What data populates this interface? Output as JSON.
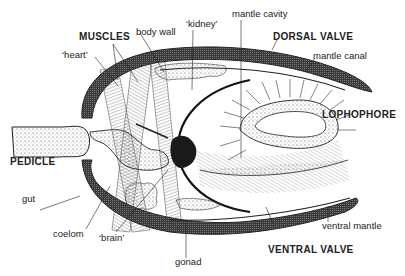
{
  "diagram": {
    "labels": {
      "muscles": "MUSCLES",
      "body_wall": "body wall",
      "kidney": "‘kidney’",
      "mantle_cavity": "mantle cavity",
      "heart": "‘heart’",
      "dorsal_valve": "DORSAL VALVE",
      "mantle_canal": "mantle canal",
      "lophophore": "LOPHOPHORE",
      "pedicle": "PEDICLE",
      "gut": "gut",
      "coelom": "coelom",
      "brain": "‘brain’",
      "gonad": "gonad",
      "ventral_mantle": "ventral mantle",
      "ventral_valve": "VENTRAL VALVE"
    },
    "colors": {
      "ink": "#222222",
      "shell": "#3a3a3a",
      "background": "#ffffff"
    }
  }
}
